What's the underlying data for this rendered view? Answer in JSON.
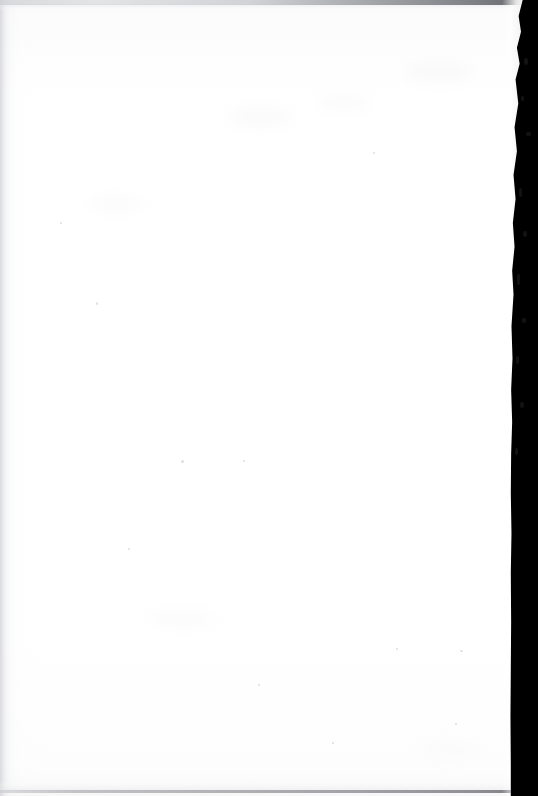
{
  "document": {
    "kind": "scanned-page",
    "page_content": "",
    "page_note": "blank page",
    "orientation": "portrait"
  },
  "page": {
    "width_px": 538,
    "height_px": 796,
    "paper_color": "#fefefe",
    "paper_tone_color": "#fbfbfc"
  },
  "scan_artifacts": {
    "gutter": {
      "name": "right-edge-scan-gutter",
      "color": "#000000",
      "side": "right",
      "width_px": 34,
      "edge_quality": "ragged-upper-straight-lower"
    },
    "page_curl_highlight": {
      "name": "page-curl-specular-highlight",
      "color": "#ffffff",
      "side": "right"
    },
    "top_edge_line": {
      "name": "page-top-edge",
      "color": "#5a5b60"
    },
    "bottom_edge_line": {
      "name": "page-bottom-edge",
      "color": "#6e6f75"
    },
    "left_edge_shading": {
      "name": "page-left-edge-shading",
      "color": "#cecfd3"
    },
    "speck_color": "#b2b3b8",
    "smudge_color": "#f1f1f3",
    "flecks": [
      {
        "x": 524,
        "y": 58,
        "w": 4,
        "h": 7
      },
      {
        "x": 521,
        "y": 96,
        "w": 3,
        "h": 5
      },
      {
        "x": 526,
        "y": 132,
        "w": 5,
        "h": 4
      },
      {
        "x": 519,
        "y": 188,
        "w": 3,
        "h": 9
      },
      {
        "x": 523,
        "y": 231,
        "w": 4,
        "h": 6
      },
      {
        "x": 517,
        "y": 274,
        "w": 3,
        "h": 11
      },
      {
        "x": 522,
        "y": 318,
        "w": 4,
        "h": 5
      },
      {
        "x": 516,
        "y": 356,
        "w": 3,
        "h": 8
      },
      {
        "x": 520,
        "y": 402,
        "w": 4,
        "h": 6
      },
      {
        "x": 515,
        "y": 448,
        "w": 3,
        "h": 7
      }
    ],
    "specks": [
      {
        "x": 181,
        "y": 460,
        "w": 3,
        "h": 3
      },
      {
        "x": 60,
        "y": 222,
        "w": 2,
        "h": 2
      },
      {
        "x": 96,
        "y": 302,
        "w": 2,
        "h": 3
      },
      {
        "x": 243,
        "y": 460,
        "w": 2,
        "h": 2
      },
      {
        "x": 373,
        "y": 152,
        "w": 2,
        "h": 2
      },
      {
        "x": 258,
        "y": 684,
        "w": 2,
        "h": 2
      },
      {
        "x": 455,
        "y": 723,
        "w": 2,
        "h": 2
      },
      {
        "x": 396,
        "y": 648,
        "w": 2,
        "h": 2
      },
      {
        "x": 460,
        "y": 650,
        "w": 3,
        "h": 2
      },
      {
        "x": 128,
        "y": 548,
        "w": 2,
        "h": 2
      },
      {
        "x": 332,
        "y": 742,
        "w": 2,
        "h": 2
      }
    ],
    "smudges": [
      {
        "x": 228,
        "y": 108,
        "w": 64,
        "h": 18,
        "opacity": 0.4
      },
      {
        "x": 318,
        "y": 96,
        "w": 52,
        "h": 14,
        "opacity": 0.32
      },
      {
        "x": 404,
        "y": 62,
        "w": 70,
        "h": 20,
        "opacity": 0.36
      },
      {
        "x": 86,
        "y": 196,
        "w": 58,
        "h": 16,
        "opacity": 0.28
      },
      {
        "x": 150,
        "y": 610,
        "w": 66,
        "h": 18,
        "opacity": 0.26
      },
      {
        "x": 420,
        "y": 742,
        "w": 60,
        "h": 16,
        "opacity": 0.24
      }
    ]
  }
}
